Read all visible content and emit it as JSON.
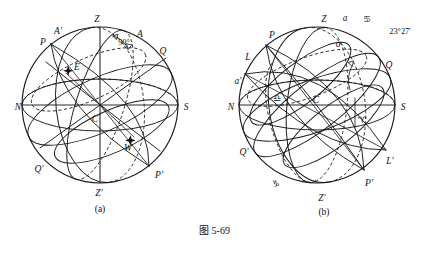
{
  "figure": {
    "caption": "图 5-69",
    "panels": [
      {
        "id": "a",
        "caption": "(a)",
        "title": "celestial-sphere-horizon-system",
        "labels": {
          "zenith": "Z",
          "nadir": "Z'",
          "pole_north": "P",
          "pole_south": "P'",
          "equator_upper": "Q",
          "equator_lower": "Q'",
          "north_point": "N",
          "south_point": "S",
          "east_point": "E",
          "west_point": "W",
          "center": "C",
          "azimuth_left": "A'",
          "azimuth_right": "A",
          "angle_90": "90°"
        }
      },
      {
        "id": "b",
        "caption": "(b)",
        "title": "celestial-sphere-ecliptic-system",
        "labels": {
          "zenith": "Z",
          "nadir": "Z'",
          "pole_north": "P",
          "pole_south": "P'",
          "ecliptic_pole_left": "L",
          "ecliptic_pole_right": "L'",
          "equator_right": "Q",
          "equator_lower_left": "Q'",
          "center": "C",
          "north_point": "N",
          "south_point": "S",
          "alpha_top": "a",
          "alpha_left": "a'",
          "sigma": "σ",
          "obliquity": "23°27'",
          "sign_cancer": "♋",
          "sign_libra": "♎",
          "sign_capricorn": "♑",
          "sign_aries": "♈"
        }
      }
    ]
  }
}
